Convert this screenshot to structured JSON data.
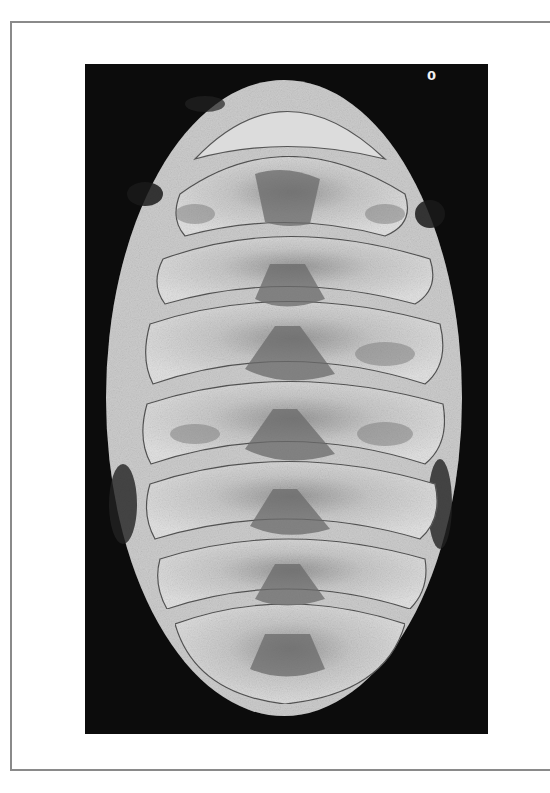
{
  "figure": {
    "plate_label": "0",
    "plate_count": 8,
    "colors": {
      "frame_border": "#8a8a8a",
      "photo_background": "#0c0c0c",
      "girdle": "#cfcfcf",
      "valve_light": "#d8d8d8",
      "valve_dark": "#6f6f6f"
    }
  }
}
